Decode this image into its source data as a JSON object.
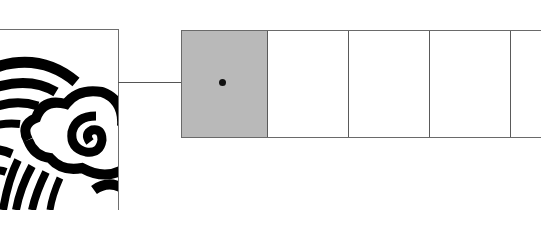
{
  "diagram": {
    "source_image": {
      "icon": "cloud-wave-icon",
      "description": "cropped black-and-white stylized cloud with curved stripes"
    },
    "connector": {
      "style": "line-with-dot-endpoint"
    },
    "cells": [
      {
        "state": "selected",
        "fill": "#b9b9b9",
        "width": 86
      },
      {
        "state": "empty",
        "fill": "#ffffff",
        "width": 81
      },
      {
        "state": "empty",
        "fill": "#ffffff",
        "width": 81
      },
      {
        "state": "empty",
        "fill": "#ffffff",
        "width": 81
      },
      {
        "state": "empty",
        "fill": "#ffffff",
        "width": 30
      }
    ],
    "colors": {
      "border": "#6a6a6a",
      "selected_fill": "#b9b9b9",
      "ink": "#111111"
    }
  }
}
